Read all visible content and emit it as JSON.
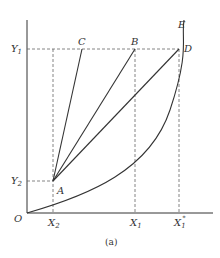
{
  "figure": {
    "caption": "(a)",
    "colors": {
      "line": "#333333",
      "dash": "#666666",
      "background": "#ffffff"
    },
    "axes": {
      "origin_label": "O",
      "x_ticks": [
        {
          "label": "X",
          "sub": "2",
          "x": 53
        },
        {
          "label": "X",
          "sub": "1",
          "x": 135
        },
        {
          "label": "X",
          "sub": "1",
          "sup": "*",
          "x": 179
        }
      ],
      "y_ticks": [
        {
          "label": "Y",
          "sub": "1",
          "y": 49
        },
        {
          "label": "Y",
          "sub": "2",
          "y": 181
        }
      ]
    },
    "points": {
      "A": {
        "label": "A",
        "x": 53,
        "y": 181
      },
      "B": {
        "label": "B",
        "x": 135,
        "y": 49
      },
      "C": {
        "label": "C",
        "x": 82,
        "y": 49
      },
      "D": {
        "label": "D",
        "x": 179,
        "y": 49
      },
      "E": {
        "label": "E",
        "x": 182,
        "y": 22
      }
    },
    "segments": [
      "A-C",
      "A-B",
      "A-D"
    ],
    "curves": [
      "O-D-E convex curve"
    ]
  }
}
